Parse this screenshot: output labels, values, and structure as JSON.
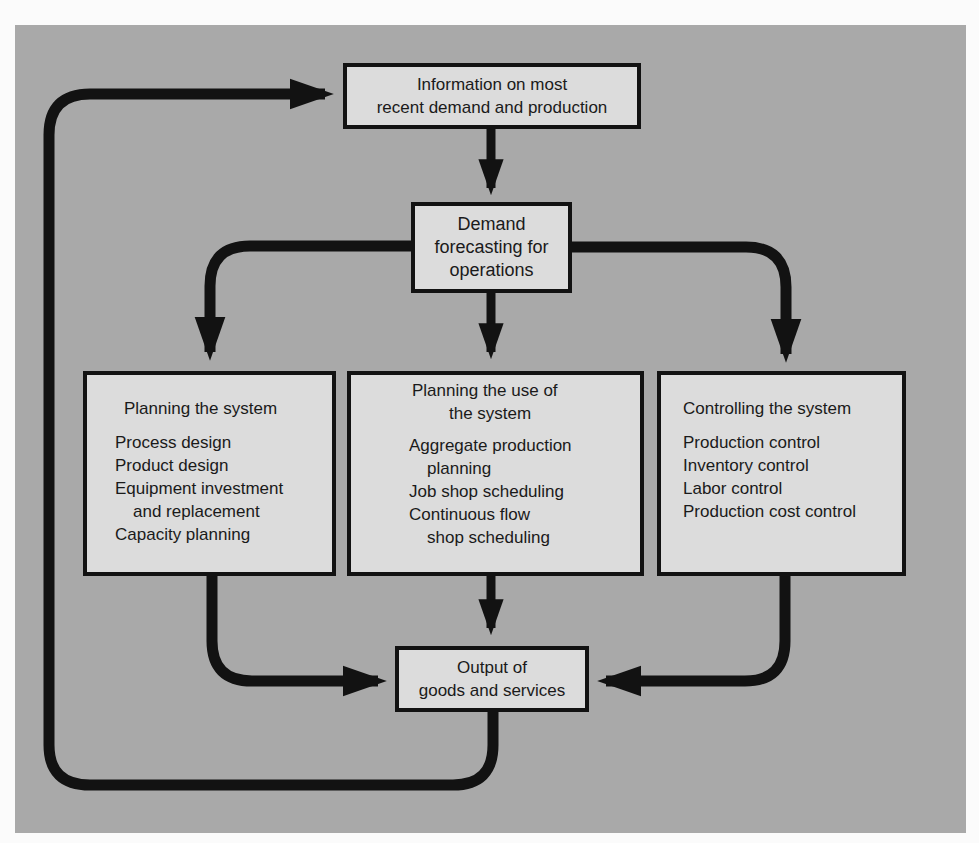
{
  "colors": {
    "page_background": "#fbfbfb",
    "panel_background": "#a9a9a9",
    "box_fill": "#dcdcdc",
    "line_color": "#121212"
  },
  "nodes": {
    "information": {
      "lines": [
        "Information on most",
        "recent demand and production"
      ]
    },
    "forecasting": {
      "lines": [
        "Demand",
        "forecasting for",
        "operations"
      ]
    },
    "planning_system": {
      "title": "Planning the system",
      "items": [
        {
          "text": "Process design",
          "indent": false
        },
        {
          "text": "Product design",
          "indent": false
        },
        {
          "text": "Equipment investment",
          "indent": false
        },
        {
          "text": "and replacement",
          "indent": true
        },
        {
          "text": "Capacity planning",
          "indent": false
        }
      ]
    },
    "planning_use": {
      "title_lines": [
        "Planning the use of",
        "the system"
      ],
      "items": [
        {
          "text": "Aggregate production",
          "indent": false
        },
        {
          "text": "planning",
          "indent": true
        },
        {
          "text": "Job shop scheduling",
          "indent": false
        },
        {
          "text": "Continuous flow",
          "indent": false
        },
        {
          "text": "shop scheduling",
          "indent": true
        }
      ]
    },
    "controlling": {
      "title": "Controlling the system",
      "items": [
        {
          "text": "Production control",
          "indent": false
        },
        {
          "text": "Inventory control",
          "indent": false
        },
        {
          "text": "Labor control",
          "indent": false
        },
        {
          "text": "Production cost control",
          "indent": false
        }
      ]
    },
    "output": {
      "lines": [
        "Output of",
        "goods and services"
      ]
    }
  },
  "edges": [
    {
      "from": "information",
      "to": "forecasting"
    },
    {
      "from": "forecasting",
      "to": "planning_system"
    },
    {
      "from": "forecasting",
      "to": "planning_use"
    },
    {
      "from": "forecasting",
      "to": "controlling"
    },
    {
      "from": "planning_system",
      "to": "output"
    },
    {
      "from": "planning_use",
      "to": "output"
    },
    {
      "from": "controlling",
      "to": "output"
    },
    {
      "from": "output",
      "to": "information",
      "type": "feedback-loop"
    }
  ]
}
